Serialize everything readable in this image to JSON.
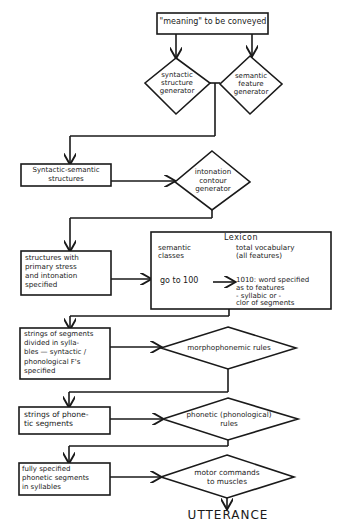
{
  "diagram": {
    "start": {
      "label": "\"meaning\" to be conveyed"
    },
    "syntactic_generator": {
      "label": "syntactic\nstructure\ngenerator"
    },
    "semantic_generator": {
      "label": "semantic\nfeature\ngenerator"
    },
    "syntactic_semantic": {
      "label": "Syntactic-semantic\nstructures"
    },
    "intonation_generator": {
      "label": "intonation\ncontour\ngenerator"
    },
    "stress_structures": {
      "label": "structures with\nprimary stress\nand intonation\nspecified"
    },
    "lexicon": {
      "title": "Lexicon",
      "col1_header": "semantic\nclasses",
      "col2_header": "total vocabulary\n(all features)",
      "col1_value": "go to 100",
      "col2_value": "1010: word specified\nas to features\n- syllabic or -\nclor of segments"
    },
    "segment_strings": {
      "label": "strings of segments\ndivided in sylla-\nbles — syntactic /\nphonological F's\nspecified"
    },
    "morphophonemic": {
      "label": "morphophonemic rules"
    },
    "phonetic_strings": {
      "label": "strings of phone-\ntic segments"
    },
    "phonetic_rules": {
      "label": "phonetic (phonological)\nrules"
    },
    "full_segments": {
      "label": "fully specified\nphonetic segments\nin syllables"
    },
    "motor_commands": {
      "label": "motor commands\nto muscles"
    },
    "end": {
      "label": "UTTERANCE"
    }
  }
}
